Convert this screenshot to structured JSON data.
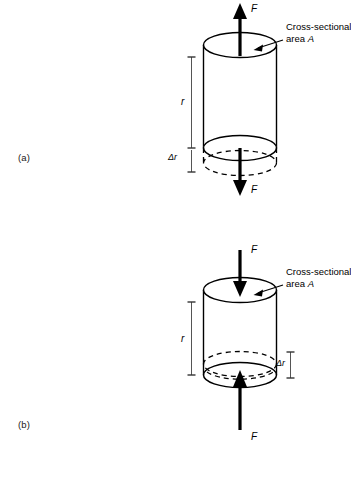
{
  "figure": {
    "type": "physics-diagram",
    "panels": [
      {
        "id": "a",
        "label": "(a)",
        "mode": "tension",
        "force_top_label": "F",
        "force_top_direction": "up",
        "force_bottom_label": "F",
        "force_bottom_direction": "down",
        "length_label": "r",
        "delta_label": "Δr",
        "delta_side": "left",
        "deformed_edge_position": "below",
        "area_caption_line1": "Cross-sectional",
        "area_caption_line2_prefix": "area",
        "area_caption_symbol": "A"
      },
      {
        "id": "b",
        "label": "(b)",
        "mode": "compression",
        "force_top_label": "F",
        "force_top_direction": "down",
        "force_bottom_label": "F",
        "force_bottom_direction": "up",
        "length_label": "r",
        "delta_label": "Δr",
        "delta_side": "right",
        "deformed_edge_position": "above",
        "area_caption_line1": "Cross-sectional",
        "area_caption_line2_prefix": "area",
        "area_caption_symbol": "A"
      }
    ],
    "colors": {
      "ink": "#000000",
      "background": "#ffffff",
      "label_gray": "#1a1a1a"
    }
  }
}
